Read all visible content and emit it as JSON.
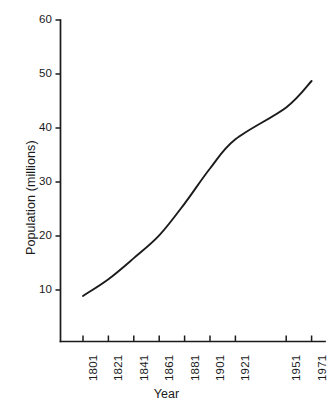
{
  "chart_data": {
    "type": "line",
    "title": "",
    "subtitle": "",
    "xlabel": "Year",
    "ylabel": "Population (millions)",
    "x_tick_labels": [
      "1801",
      "1821",
      "1841",
      "1861",
      "1881",
      "1901",
      "1921",
      "1951",
      "1971"
    ],
    "x_tick_values": [
      1801,
      1821,
      1841,
      1861,
      1881,
      1901,
      1921,
      1951,
      1971
    ],
    "y_tick_labels": [
      "10",
      "20",
      "30",
      "40",
      "50",
      "60"
    ],
    "y_tick_values": [
      10,
      20,
      30,
      40,
      50,
      60
    ],
    "ylim": [
      0,
      60
    ],
    "xlim": [
      1801,
      1971
    ],
    "grid": false,
    "legend": false,
    "legend_position": "none",
    "line_color": "#1b1b1b",
    "axis_color": "#1b1b1b",
    "background_color": "#ffffff",
    "x": [
      1801,
      1821,
      1841,
      1861,
      1881,
      1901,
      1921,
      1951,
      1971
    ],
    "values": [
      8.9,
      12.0,
      15.9,
      20.1,
      26.0,
      32.5,
      37.9,
      43.8,
      48.7
    ],
    "series": [
      {
        "name": "Population",
        "x": [
          1801,
          1821,
          1841,
          1861,
          1881,
          1901,
          1921,
          1951,
          1971
        ],
        "values": [
          8.9,
          12.0,
          15.9,
          20.1,
          26.0,
          32.5,
          37.9,
          43.8,
          48.7
        ]
      }
    ]
  },
  "axes": {
    "y_axis_name": "y-axis",
    "x_axis_name": "x-axis"
  }
}
